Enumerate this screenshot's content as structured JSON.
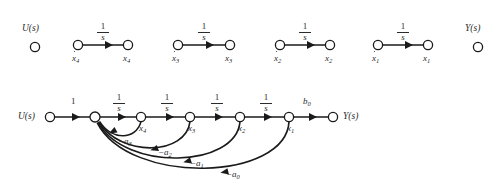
{
  "figure": {
    "type": "signal-flow-graph",
    "background_color": "#ffffff",
    "ink_color": "#1a1a1a",
    "text_color": "#2b2b2b"
  },
  "top_row": {
    "description": "Isolated integrator branches and the input/output nodes",
    "input_node": {
      "label": "U(s)",
      "cx": 35,
      "cy": 47,
      "r": 4.6,
      "label_x": 22,
      "label_y": 27
    },
    "output_node": {
      "label": "Y(s)",
      "cx": 478,
      "cy": 47,
      "r": 4.6,
      "label_x": 466,
      "label_y": 27
    },
    "integrators": [
      {
        "gain_num": "1",
        "gain_den": "s",
        "from_label": "x̄4",
        "from_sub": "4",
        "to_label": "x",
        "to_sub": "4",
        "x1": 78,
        "x2": 128,
        "cy": 45
      },
      {
        "gain_num": "1",
        "gain_den": "s",
        "from_label": "x",
        "from_sub": "3",
        "to_label": "x",
        "to_sub": "3",
        "x1": 178,
        "x2": 230,
        "cy": 45
      },
      {
        "gain_num": "1",
        "gain_den": "s",
        "from_label": "x",
        "from_sub": "2",
        "to_label": "x",
        "to_sub": "2",
        "x1": 280,
        "x2": 330,
        "cy": 45
      },
      {
        "gain_num": "1",
        "gain_den": "s",
        "from_label": "x",
        "from_sub": "1",
        "to_label": "x",
        "to_sub": "1",
        "x1": 378,
        "x2": 428,
        "cy": 45
      }
    ]
  },
  "bottom_graph": {
    "description": "Complete signal flow graph with forward path and feedback branches",
    "baseline_y": 117,
    "nodes": [
      {
        "name": "u-node",
        "label": "U(s)",
        "cx": 50,
        "cy": 117,
        "r": 4.6,
        "label_side": "left"
      },
      {
        "name": "sum-node",
        "label": "",
        "cx": 95,
        "cy": 117,
        "r": 5.0,
        "label_side": "none"
      },
      {
        "name": "x4-node",
        "label": "x",
        "sub": "4",
        "cx": 141,
        "cy": 117,
        "r": 4.6,
        "label_side": "below"
      },
      {
        "name": "x3-node",
        "label": "x",
        "sub": "3",
        "cx": 190,
        "cy": 117,
        "r": 4.6,
        "label_side": "below"
      },
      {
        "name": "x2-node",
        "label": "x",
        "sub": "2",
        "cx": 240,
        "cy": 117,
        "r": 4.6,
        "label_side": "below"
      },
      {
        "name": "x1-node",
        "label": "x",
        "sub": "1",
        "cx": 289,
        "cy": 117,
        "r": 4.6,
        "label_side": "below"
      },
      {
        "name": "y-node",
        "label": "Y(s)",
        "cx": 333,
        "cy": 117,
        "r": 4.6,
        "label_side": "right"
      }
    ],
    "forward_gains": [
      {
        "name": "gain-u-sum",
        "text": "1",
        "kind": "plain",
        "x": 72,
        "y": 101
      },
      {
        "name": "gain-integrator-4",
        "num": "1",
        "den": "s",
        "kind": "fraction",
        "x": 118,
        "y": 96
      },
      {
        "name": "gain-integrator-3",
        "num": "1",
        "den": "s",
        "kind": "fraction",
        "x": 166,
        "y": 96
      },
      {
        "name": "gain-integrator-2",
        "num": "1",
        "den": "s",
        "kind": "fraction",
        "x": 215,
        "y": 96
      },
      {
        "name": "gain-integrator-1",
        "num": "1",
        "den": "s",
        "kind": "fraction",
        "x": 264,
        "y": 96
      },
      {
        "name": "gain-output",
        "text": "b",
        "sub": "0",
        "kind": "plain",
        "x": 307,
        "y": 101
      }
    ],
    "feedback_branches": [
      {
        "name": "feedback-a3",
        "label": "−a",
        "sub": "3",
        "from_x": 141,
        "to_x": 95,
        "depth": 20,
        "label_x": 120,
        "label_y": 139
      },
      {
        "name": "feedback-a2",
        "label": "−a",
        "sub": "2",
        "from_x": 190,
        "to_x": 95,
        "depth": 34,
        "label_x": 160,
        "label_y": 150
      },
      {
        "name": "feedback-a1",
        "label": "−a",
        "sub": "1",
        "from_x": 240,
        "to_x": 95,
        "depth": 47,
        "label_x": 192,
        "label_y": 161
      },
      {
        "name": "feedback-a0",
        "label": "−a",
        "sub": "0",
        "from_x": 289,
        "to_x": 95,
        "depth": 58,
        "label_x": 228,
        "label_y": 172
      }
    ]
  }
}
